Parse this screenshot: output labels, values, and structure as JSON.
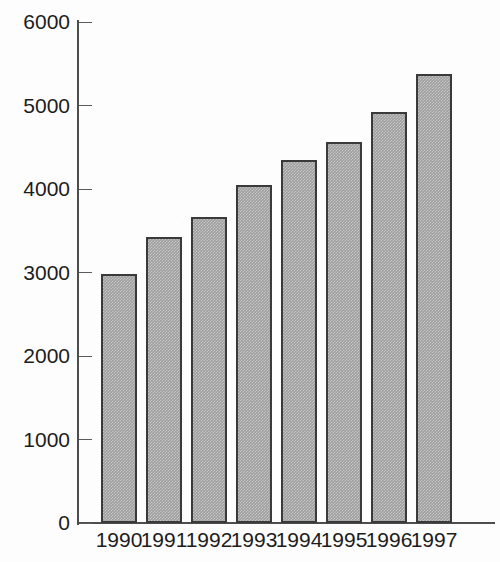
{
  "chart_data": {
    "type": "bar",
    "title": "",
    "subtitle": "",
    "xlabel": "",
    "ylabel": "",
    "categories": [
      "1990",
      "1991",
      "1992",
      "1993",
      "1994",
      "1995",
      "1996",
      "1997"
    ],
    "values": [
      2980,
      3430,
      3670,
      4050,
      4350,
      4560,
      4920,
      5380
    ],
    "series": [
      {
        "name": "",
        "values": [
          2980,
          3430,
          3670,
          4050,
          4350,
          4560,
          4920,
          5380
        ]
      }
    ],
    "ylim": [
      0,
      6000
    ],
    "yticks": [
      0,
      1000,
      2000,
      3000,
      4000,
      5000,
      6000
    ],
    "ytick_labels": [
      "0",
      "1000",
      "2000",
      "3000",
      "4000",
      "5000",
      "6000"
    ],
    "xtick_labels": [
      "1990",
      "1991",
      "1992",
      "1993",
      "1994",
      "1995",
      "1996",
      "1997"
    ],
    "grid": false,
    "legend": false,
    "legend_position": "none",
    "annotations": [],
    "bar_fill_color": "#9d9d9d",
    "bar_edge_color": "#3a3a3a",
    "axis_color": "#4d4d4d",
    "background_color": "#fdfdfd",
    "text_color": "#1c1c1c"
  }
}
